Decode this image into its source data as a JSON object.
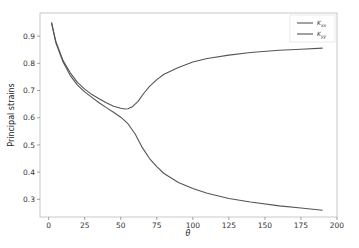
{
  "chart_data": {
    "type": "line",
    "title": "",
    "xlabel": "θ",
    "ylabel": "Principal strains",
    "xlim": [
      -6,
      200
    ],
    "ylim": [
      0.235,
      0.985
    ],
    "xticks": [
      0,
      25,
      50,
      75,
      100,
      125,
      150,
      175,
      200
    ],
    "yticks": [
      0.3,
      0.4,
      0.5,
      0.6,
      0.7,
      0.8,
      0.9
    ],
    "xtick_labels": [
      "0",
      "25",
      "50",
      "75",
      "100",
      "125",
      "150",
      "175",
      "200"
    ],
    "ytick_labels": [
      "0.3",
      "0.4",
      "0.5",
      "0.6",
      "0.7",
      "0.8",
      "0.9"
    ],
    "grid": false,
    "legend_position": "upper right",
    "series": [
      {
        "name": "K_xx",
        "label_main": "K",
        "label_sub": "xx",
        "color": "#555555",
        "x": [
          2,
          5,
          10,
          15,
          20,
          25,
          30,
          35,
          40,
          45,
          50,
          53,
          55,
          58,
          62,
          66,
          70,
          75,
          80,
          90,
          100,
          110,
          125,
          140,
          160,
          175,
          190
        ],
        "y": [
          0.95,
          0.88,
          0.81,
          0.765,
          0.73,
          0.705,
          0.685,
          0.67,
          0.655,
          0.642,
          0.635,
          0.632,
          0.633,
          0.64,
          0.66,
          0.69,
          0.715,
          0.74,
          0.76,
          0.785,
          0.805,
          0.818,
          0.83,
          0.84,
          0.848,
          0.852,
          0.856
        ]
      },
      {
        "name": "K_yy",
        "label_main": "K",
        "label_sub": "yy",
        "color": "#555555",
        "x": [
          2,
          5,
          10,
          15,
          20,
          25,
          30,
          35,
          40,
          45,
          50,
          55,
          60,
          65,
          70,
          75,
          80,
          90,
          100,
          110,
          125,
          140,
          160,
          175,
          190
        ],
        "y": [
          0.95,
          0.875,
          0.805,
          0.755,
          0.72,
          0.695,
          0.675,
          0.655,
          0.637,
          0.62,
          0.602,
          0.578,
          0.54,
          0.49,
          0.45,
          0.42,
          0.395,
          0.362,
          0.34,
          0.322,
          0.303,
          0.29,
          0.276,
          0.268,
          0.26
        ]
      }
    ]
  }
}
